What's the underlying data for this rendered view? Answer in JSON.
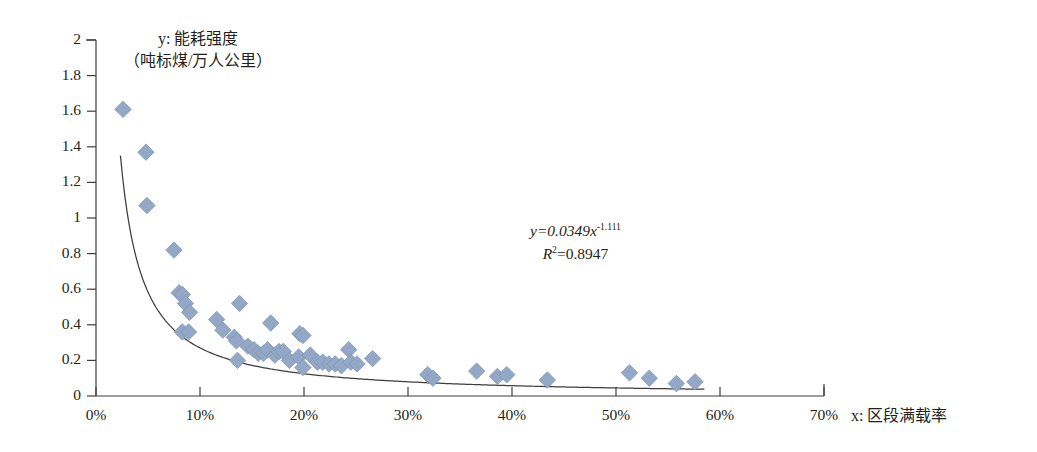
{
  "chart_data": {
    "type": "scatter",
    "title": "",
    "xlabel": "x: 区段满载率",
    "ylabel": "y: 能耗强度（吨标煤/万人公里）",
    "ylabel_line1": "y: 能耗强度",
    "ylabel_line2": "（吨标煤/万人公里）",
    "xlim": [
      0,
      70
    ],
    "ylim": [
      0,
      2
    ],
    "x_ticks": [
      0,
      10,
      20,
      30,
      40,
      50,
      60,
      70
    ],
    "x_tick_labels": [
      "0%",
      "10%",
      "20%",
      "30%",
      "40%",
      "50%",
      "60%",
      "70%"
    ],
    "y_ticks": [
      0,
      0.2,
      0.4,
      0.6,
      0.8,
      1,
      1.2,
      1.4,
      1.6,
      1.8,
      2
    ],
    "y_tick_labels": [
      "0",
      "0.2",
      "0.4",
      "0.6",
      "0.8",
      "1",
      "1.2",
      "1.4",
      "1.6",
      "1.8",
      "2"
    ],
    "grid": false,
    "legend": false,
    "marker": "diamond",
    "marker_color": "#93a7c6",
    "marker_edge_color": "#8096b8",
    "trendline_color": "#403d3c",
    "annotation": {
      "equation_prefix": "y=0.0349x",
      "equation_exponent": "-1.111",
      "r2_prefix": "R",
      "r2_sup": "2",
      "r2_value": "=0.8947"
    },
    "fit": {
      "type": "power",
      "coefficient": 0.0349,
      "exponent": -1.111,
      "r_squared": 0.8947,
      "x_start": 2.35,
      "x_end": 58.5
    },
    "points": [
      {
        "x": 2.6,
        "y": 1.61
      },
      {
        "x": 4.8,
        "y": 1.37
      },
      {
        "x": 4.9,
        "y": 1.07
      },
      {
        "x": 7.5,
        "y": 0.82
      },
      {
        "x": 8.0,
        "y": 0.58
      },
      {
        "x": 8.3,
        "y": 0.57
      },
      {
        "x": 8.6,
        "y": 0.52
      },
      {
        "x": 9.0,
        "y": 0.47
      },
      {
        "x": 8.3,
        "y": 0.36
      },
      {
        "x": 8.9,
        "y": 0.36
      },
      {
        "x": 11.6,
        "y": 0.43
      },
      {
        "x": 12.2,
        "y": 0.37
      },
      {
        "x": 13.3,
        "y": 0.33
      },
      {
        "x": 13.5,
        "y": 0.31
      },
      {
        "x": 13.8,
        "y": 0.52
      },
      {
        "x": 13.6,
        "y": 0.2
      },
      {
        "x": 14.6,
        "y": 0.28
      },
      {
        "x": 15.2,
        "y": 0.26
      },
      {
        "x": 15.6,
        "y": 0.24
      },
      {
        "x": 16.1,
        "y": 0.24
      },
      {
        "x": 16.8,
        "y": 0.41
      },
      {
        "x": 16.5,
        "y": 0.26
      },
      {
        "x": 17.2,
        "y": 0.23
      },
      {
        "x": 17.6,
        "y": 0.25
      },
      {
        "x": 18.0,
        "y": 0.25
      },
      {
        "x": 18.6,
        "y": 0.2
      },
      {
        "x": 19.6,
        "y": 0.35
      },
      {
        "x": 19.9,
        "y": 0.34
      },
      {
        "x": 19.5,
        "y": 0.22
      },
      {
        "x": 19.9,
        "y": 0.16
      },
      {
        "x": 20.6,
        "y": 0.23
      },
      {
        "x": 21.3,
        "y": 0.19
      },
      {
        "x": 21.8,
        "y": 0.19
      },
      {
        "x": 22.4,
        "y": 0.18
      },
      {
        "x": 23.0,
        "y": 0.18
      },
      {
        "x": 23.6,
        "y": 0.17
      },
      {
        "x": 24.3,
        "y": 0.26
      },
      {
        "x": 24.5,
        "y": 0.19
      },
      {
        "x": 25.1,
        "y": 0.18
      },
      {
        "x": 26.6,
        "y": 0.21
      },
      {
        "x": 31.9,
        "y": 0.12
      },
      {
        "x": 32.4,
        "y": 0.1
      },
      {
        "x": 36.6,
        "y": 0.14
      },
      {
        "x": 38.6,
        "y": 0.11
      },
      {
        "x": 39.5,
        "y": 0.12
      },
      {
        "x": 43.4,
        "y": 0.09
      },
      {
        "x": 51.3,
        "y": 0.13
      },
      {
        "x": 53.2,
        "y": 0.1
      },
      {
        "x": 55.8,
        "y": 0.07
      },
      {
        "x": 57.6,
        "y": 0.08
      }
    ]
  },
  "axes_geometry": {
    "left_px": 96,
    "right_px": 824,
    "top_px": 40,
    "bottom_px": 396
  }
}
